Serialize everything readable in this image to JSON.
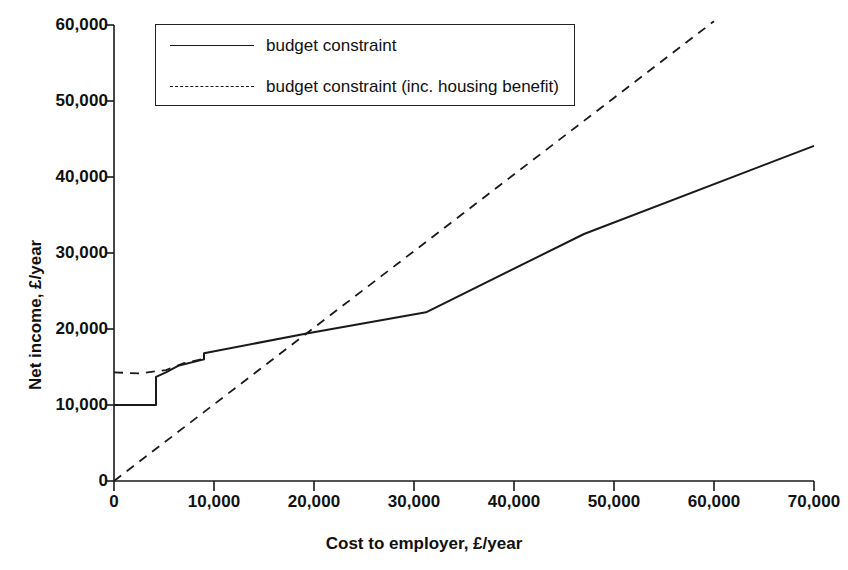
{
  "chart_data": {
    "type": "line",
    "title": "",
    "xlabel": "Cost to employer, £/year",
    "ylabel": "Net income, £/year",
    "xlim": [
      0,
      70000
    ],
    "ylim": [
      0,
      60000
    ],
    "xticks": [
      0,
      10000,
      20000,
      30000,
      40000,
      50000,
      60000,
      70000
    ],
    "yticks": [
      0,
      10000,
      20000,
      30000,
      40000,
      50000,
      60000
    ],
    "xticklabels": [
      "0",
      "10,000",
      "20,000",
      "30,000",
      "40,000",
      "50,000",
      "60,000",
      "70,000"
    ],
    "yticklabels": [
      "0",
      "10,000",
      "20,000",
      "30,000",
      "40,000",
      "50,000",
      "60,000"
    ],
    "grid": false,
    "legend_position": "upper left",
    "series": [
      {
        "name": "budget constraint",
        "style": "solid",
        "color": "#1a1a1a",
        "points": [
          [
            0,
            10000
          ],
          [
            4200,
            10000
          ],
          [
            4200,
            13700
          ],
          [
            5200,
            14300
          ],
          [
            6500,
            15200
          ],
          [
            9000,
            16000
          ],
          [
            9000,
            16800
          ],
          [
            19400,
            19450
          ],
          [
            31200,
            22200
          ],
          [
            47000,
            32500
          ],
          [
            70000,
            44100
          ]
        ]
      },
      {
        "name": "budget constraint (inc. housing benefit)",
        "style": "dashed",
        "color": "#1a1a1a",
        "points": [
          [
            0,
            14300
          ],
          [
            2500,
            14150
          ],
          [
            5200,
            14600
          ],
          [
            7000,
            15500
          ],
          [
            9000,
            16100
          ]
        ]
      },
      {
        "name": "45-degree reference (inc. housing benefit upper arm)",
        "style": "dashed",
        "color": "#1a1a1a",
        "points": [
          [
            0,
            0
          ],
          [
            60000,
            60500
          ]
        ]
      }
    ]
  },
  "legend": {
    "items": [
      {
        "label": "budget constraint",
        "style": "solid"
      },
      {
        "label": "budget constraint (inc. housing benefit)",
        "style": "dashed"
      }
    ]
  }
}
